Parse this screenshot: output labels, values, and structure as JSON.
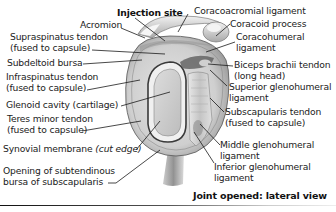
{
  "figure": {
    "subtitle": "Joint opened: lateral view",
    "colors": {
      "line": "#1a1a1a",
      "bone_light": "#eeeeee",
      "bone_mid": "#c8c8c8",
      "bone_dark": "#8a8a8a",
      "cartilage": "#d2d2d2"
    }
  },
  "labels_left": [
    {
      "id": "injection-site",
      "text": "Injection site"
    },
    {
      "id": "acromion",
      "text": "Acromion"
    },
    {
      "id": "supraspinatus-tendon",
      "line1": "Supraspinatus tendon",
      "line2": "(fused to capsule)"
    },
    {
      "id": "subdeltoid-bursa",
      "text": "Subdeltoid bursa"
    },
    {
      "id": "infraspinatus-tendon",
      "line1": "Infraspinatus tendon",
      "line2": "(fused to capsule)"
    },
    {
      "id": "glenoid-cavity",
      "text": "Glenoid cavity (cartilage)"
    },
    {
      "id": "teres-minor-tendon",
      "line1": "Teres minor tendon",
      "line2": "(fused to capsule)"
    },
    {
      "id": "synovial-membrane",
      "text": "Synovial membrane",
      "italic": "(cut edge)"
    },
    {
      "id": "opening-subtendinous-bursa",
      "line1": "Opening of subtendinous",
      "line2": "bursa of subscapularis"
    }
  ],
  "labels_right": [
    {
      "id": "coracoacromial-ligament",
      "text": "Coracoacromial ligament"
    },
    {
      "id": "coracoid-process",
      "text": "Coracoid process"
    },
    {
      "id": "coracohumeral-ligament",
      "line1": "Coracohumeral",
      "line2": "ligament"
    },
    {
      "id": "biceps-brachii-tendon",
      "line1": "Biceps brachii tendon",
      "line2": "(long head)"
    },
    {
      "id": "superior-glenohumeral-ligament",
      "line1": "Superior glenohumeral",
      "line2": "ligament"
    },
    {
      "id": "subscapularis-tendon",
      "line1": "Subscapularis tendon",
      "line2": "(fused to capsule)"
    },
    {
      "id": "middle-glenohumeral-ligament",
      "line1": "Middle glenohumeral",
      "line2": "ligament"
    },
    {
      "id": "inferior-glenohumeral-ligament",
      "line1": "Inferior glenohumeral",
      "line2": "ligament"
    }
  ]
}
